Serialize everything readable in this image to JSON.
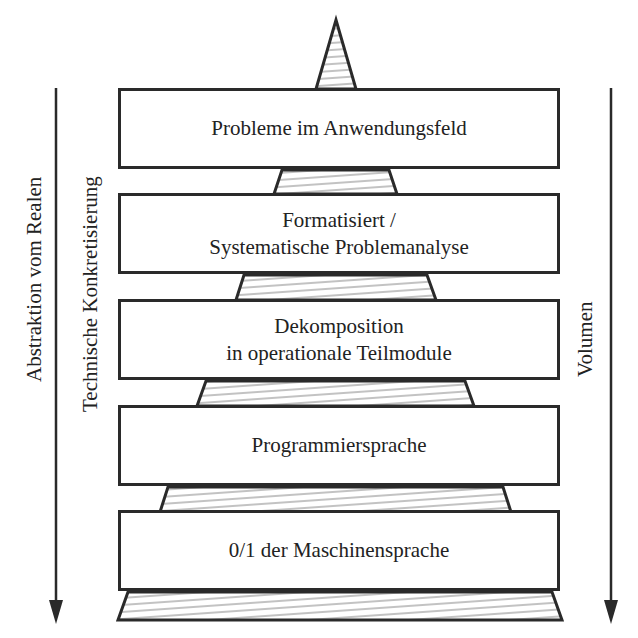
{
  "diagram": {
    "type": "layered-pyramid",
    "levels": [
      {
        "lines": [
          "Probleme im Anwendungsfeld"
        ]
      },
      {
        "lines": [
          "Formatisiert /",
          "Systematische Problemanalyse"
        ]
      },
      {
        "lines": [
          "Dekomposition",
          "in operationale Teilmodule"
        ]
      },
      {
        "lines": [
          "Programmiersprache"
        ]
      },
      {
        "lines": [
          "0/1 der Maschinensprache"
        ]
      }
    ],
    "left_axis": {
      "outer_label": "Abstraktion vom Realen",
      "inner_label": "Technische Konkretisierung",
      "direction": "down"
    },
    "right_axis": {
      "label": "Volumen",
      "direction": "down"
    },
    "colors": {
      "stroke": "#2a2a2a",
      "hatch": "#555555",
      "background": "#ffffff"
    }
  }
}
